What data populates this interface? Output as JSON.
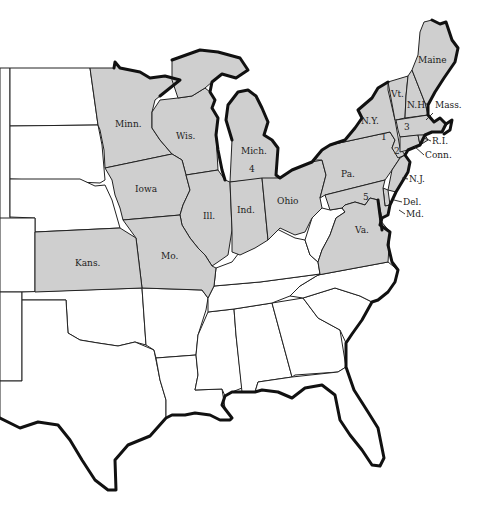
{
  "map": {
    "colors": {
      "highlighted": "#cfcfcf",
      "plain": "#ffffff",
      "border": "#222222",
      "coast": "#111111"
    },
    "highlighted_states": [
      {
        "id": "maine",
        "label": "Maine"
      },
      {
        "id": "vermont",
        "label": "Vt."
      },
      {
        "id": "new-hampshire",
        "label": "N.H."
      },
      {
        "id": "massachusetts",
        "label": "Mass."
      },
      {
        "id": "rhode-island",
        "label": "R.I."
      },
      {
        "id": "connecticut",
        "label": "Conn."
      },
      {
        "id": "new-york",
        "label": "N.Y."
      },
      {
        "id": "new-jersey",
        "label": "N.J."
      },
      {
        "id": "pennsylvania",
        "label": "Pa."
      },
      {
        "id": "delaware",
        "label": "Del."
      },
      {
        "id": "maryland",
        "label": "Md."
      },
      {
        "id": "virginia",
        "label": "Va."
      },
      {
        "id": "ohio",
        "label": "Ohio"
      },
      {
        "id": "michigan",
        "label": "Mich."
      },
      {
        "id": "indiana",
        "label": "Ind."
      },
      {
        "id": "illinois",
        "label": "Ill."
      },
      {
        "id": "wisconsin",
        "label": "Wis."
      },
      {
        "id": "minnesota",
        "label": "Minn."
      },
      {
        "id": "iowa",
        "label": "Iowa"
      },
      {
        "id": "missouri",
        "label": "Mo."
      },
      {
        "id": "kansas",
        "label": "Kans."
      }
    ],
    "unlabeled_white_states": [
      "North Dakota",
      "South Dakota",
      "Nebraska",
      "Oklahoma",
      "Texas",
      "Arkansas",
      "Louisiana",
      "Mississippi",
      "Alabama",
      "Georgia",
      "Florida",
      "Tennessee",
      "Kentucky",
      "West Virginia",
      "North Carolina",
      "South Carolina",
      "Colorado",
      "New Mexico",
      "Wyoming",
      "Montana"
    ],
    "markers": [
      {
        "id": "marker-1",
        "label": "1"
      },
      {
        "id": "marker-2",
        "label": "2"
      },
      {
        "id": "marker-3",
        "label": "3"
      },
      {
        "id": "marker-4",
        "label": "4"
      },
      {
        "id": "marker-5",
        "label": "5"
      }
    ]
  }
}
